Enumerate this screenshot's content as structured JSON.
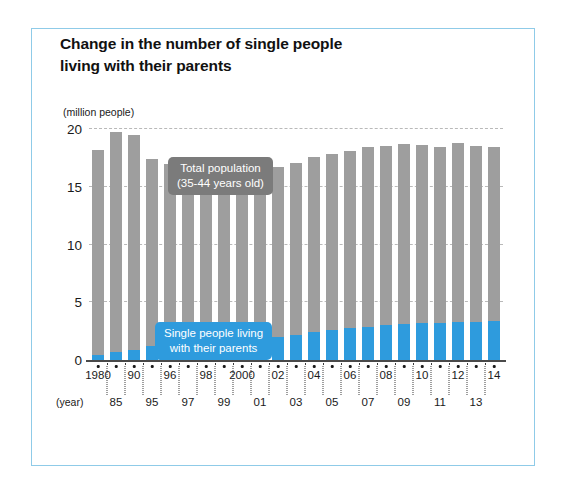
{
  "figure": {
    "title_line1": "Change in the number of single people",
    "title_line2": "living with their parents",
    "border_color": "#8fcbe8",
    "year_unit_label": "(year)"
  },
  "legend": {
    "total": {
      "line1": "Total population",
      "line2": "(35-44 years old)",
      "color": "#7b7b7b"
    },
    "single": {
      "line1": "Single people living",
      "line2": "with their parents",
      "color": "#2e9bdd"
    }
  },
  "chart_data": {
    "type": "bar",
    "stacked": true,
    "title": "Change in the number of single people living with their parents",
    "xlabel": "(year)",
    "ylabel": "(million people)",
    "yunit": "million people",
    "ylim": [
      0,
      20
    ],
    "yticks": [
      0,
      5,
      10,
      15,
      20
    ],
    "ytick_labels": [
      "0",
      "5",
      "10",
      "15",
      "20"
    ],
    "grid": true,
    "grid_style": "dashed-horizontal",
    "legend_position": "inside-plot",
    "categories": [
      "1980",
      "85",
      "90",
      "95",
      "96",
      "97",
      "98",
      "99",
      "2000",
      "01",
      "02",
      "03",
      "04",
      "05",
      "06",
      "07",
      "08",
      "09",
      "10",
      "11",
      "12",
      "13",
      "14"
    ],
    "xtick_labels_top": [
      "1980",
      "90",
      "96",
      "98",
      "2000",
      "02",
      "04",
      "06",
      "08",
      "10",
      "12",
      "14"
    ],
    "xtick_labels_bottom": [
      "85",
      "95",
      "97",
      "99",
      "01",
      "03",
      "05",
      "07",
      "09",
      "11",
      "13"
    ],
    "series": [
      {
        "name": "Total population (35-44 years old)",
        "color": "#9e9e9e",
        "values": [
          18.2,
          19.7,
          19.5,
          17.4,
          17.0,
          16.6,
          16.4,
          16.5,
          16.5,
          16.1,
          16.7,
          17.1,
          17.6,
          17.8,
          18.1,
          18.4,
          18.5,
          18.7,
          18.6,
          18.4,
          18.8,
          18.5,
          18.4
        ]
      },
      {
        "name": "Single people living with their parents",
        "color": "#2e9bdd",
        "values": [
          0.4,
          0.7,
          0.9,
          1.2,
          1.3,
          1.4,
          1.5,
          1.6,
          1.8,
          1.8,
          2.0,
          2.2,
          2.4,
          2.6,
          2.8,
          2.9,
          3.0,
          3.1,
          3.2,
          3.2,
          3.3,
          3.3,
          3.4
        ]
      }
    ]
  }
}
